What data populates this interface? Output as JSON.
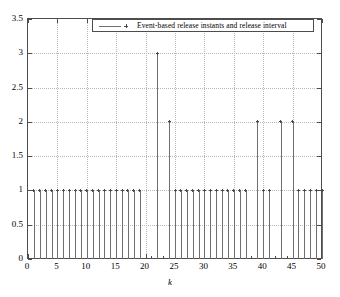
{
  "figure": {
    "xlabel": "k",
    "legend_label": "Event-based release instants and release interval",
    "legend_position": "top-center",
    "grid": "dotted"
  },
  "axes": {
    "y_ticks": [
      "0",
      "0.5",
      "1",
      "1.5",
      "2",
      "2.5",
      "3",
      "3.5"
    ],
    "x_ticks": [
      "0",
      "5",
      "10",
      "15",
      "20",
      "25",
      "30",
      "35",
      "40",
      "45",
      "50"
    ]
  },
  "chart_data": {
    "type": "line",
    "style": "stem",
    "title": "",
    "xlabel": "k",
    "ylabel": "",
    "xlim": [
      0,
      50
    ],
    "ylim": [
      0,
      3.5
    ],
    "grid": true,
    "legend": [
      "Event-based release instants and release interval"
    ],
    "legend_position": "upper center",
    "x": [
      1,
      2,
      3,
      4,
      5,
      6,
      7,
      8,
      9,
      10,
      11,
      12,
      13,
      14,
      15,
      16,
      17,
      18,
      19,
      22,
      24,
      25,
      26,
      27,
      28,
      29,
      30,
      31,
      32,
      33,
      34,
      35,
      36,
      37,
      39,
      40,
      41,
      43,
      45,
      46,
      47,
      48,
      49,
      50
    ],
    "y": [
      1,
      1,
      1,
      1,
      1,
      1,
      1,
      1,
      1,
      1,
      1,
      1,
      1,
      1,
      1,
      1,
      1,
      1,
      1,
      3,
      2,
      1,
      1,
      1,
      1,
      1,
      1,
      1,
      1,
      1,
      1,
      1,
      1,
      1,
      2,
      1,
      1,
      2,
      2,
      1,
      1,
      1,
      1,
      1
    ],
    "marker": "star",
    "color": "#6f6f6f"
  },
  "colors": {
    "axis": "#4d4d4d",
    "grid": "#b9b9b9",
    "stem": "#7a7a7a",
    "marker": "#4a4a4a",
    "background": "#ffffff"
  }
}
